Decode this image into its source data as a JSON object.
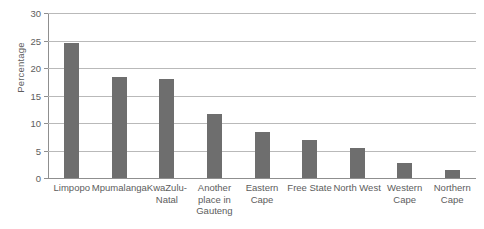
{
  "chart_data": {
    "type": "bar",
    "title": "",
    "xlabel": "",
    "ylabel": "Percentage",
    "ylim": [
      0,
      30
    ],
    "yticks": [
      0,
      5,
      10,
      15,
      20,
      25,
      30
    ],
    "ytick_labels": [
      "0",
      "5",
      "10",
      "15",
      "20",
      "25",
      "30"
    ],
    "grid": true,
    "legend": false,
    "bar_color": "#6e6e6e",
    "grid_color": "#b9b9b9",
    "axis_color": "#8f8f8f",
    "text_color": "#5d5d5d",
    "categories": [
      "Limpopo",
      "Mpumalanga",
      "KwaZulu-Natal",
      "Another place in Gauteng",
      "Eastern Cape",
      "Free State",
      "North West",
      "Western Cape",
      "Northern Cape"
    ],
    "category_label_lines": [
      [
        "Limpopo"
      ],
      [
        "Mpumalanga"
      ],
      [
        "KwaZulu-",
        "Natal"
      ],
      [
        "Another",
        "place in",
        "Gauteng"
      ],
      [
        "Eastern",
        "Cape"
      ],
      [
        "Free State"
      ],
      [
        "North West"
      ],
      [
        "Western",
        "Cape"
      ],
      [
        "Northern",
        "Cape"
      ]
    ],
    "values": [
      24.6,
      18.3,
      18.0,
      11.7,
      8.4,
      7.0,
      5.5,
      2.7,
      1.4
    ]
  }
}
